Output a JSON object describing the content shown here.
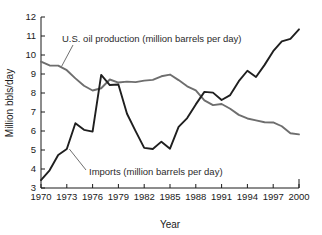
{
  "chart_data": {
    "type": "line",
    "title": "",
    "xlabel": "Year",
    "ylabel": "Million bbls/day",
    "xlim": [
      1970,
      2000
    ],
    "ylim": [
      3,
      12
    ],
    "ytick_labels": [
      "12",
      "11",
      "10",
      "9",
      "8",
      "7",
      "6",
      "5",
      "4",
      "3"
    ],
    "ytick_values": [
      12,
      11,
      10,
      9,
      8,
      7,
      6,
      5,
      4,
      3
    ],
    "xtick_labels": [
      "1970",
      "1973",
      "1976",
      "1979",
      "1982",
      "1985",
      "1988",
      "1991",
      "1994",
      "1997",
      "2000"
    ],
    "xtick_values": [
      1970,
      1973,
      1976,
      1979,
      1982,
      1985,
      1988,
      1991,
      1994,
      1997,
      2000
    ],
    "grid": false,
    "legend_position": "in-plot-annotations",
    "x": [
      1970,
      1971,
      1972,
      1973,
      1974,
      1975,
      1976,
      1977,
      1978,
      1979,
      1980,
      1981,
      1982,
      1983,
      1984,
      1985,
      1986,
      1987,
      1988,
      1989,
      1990,
      1991,
      1992,
      1993,
      1994,
      1995,
      1996,
      1997,
      1998,
      1999,
      2000
    ],
    "series": [
      {
        "name": "U.S. oil production (million barrels per day)",
        "color": "#6e6e6e",
        "values": [
          9.65,
          9.45,
          9.44,
          9.2,
          8.77,
          8.38,
          8.13,
          8.25,
          8.71,
          8.55,
          8.6,
          8.57,
          8.65,
          8.69,
          8.88,
          8.97,
          8.68,
          8.35,
          8.14,
          7.61,
          7.36,
          7.42,
          7.17,
          6.85,
          6.66,
          6.56,
          6.46,
          6.45,
          6.25,
          5.88,
          5.82
        ]
      },
      {
        "name": "Imports (million barrels per day)",
        "color": "#1f1f1f",
        "values": [
          3.42,
          3.93,
          4.74,
          5.05,
          6.41,
          6.06,
          5.97,
          8.95,
          8.42,
          8.45,
          6.91,
          5.99,
          5.11,
          5.05,
          5.44,
          5.07,
          6.22,
          6.68,
          7.4,
          8.06,
          8.02,
          7.63,
          7.89,
          8.62,
          9.17,
          8.84,
          9.48,
          10.2,
          10.72,
          10.85,
          11.35
        ]
      }
    ],
    "annotations": [
      {
        "text": "U.S. oil production (million barrels per day)",
        "target_series": "production",
        "target_x": 1972.4,
        "target_y": 9.4
      },
      {
        "text": "Imports (million barrels per day)",
        "target_series": "imports",
        "target_x": 1973.3,
        "target_y": 5.05
      }
    ]
  }
}
